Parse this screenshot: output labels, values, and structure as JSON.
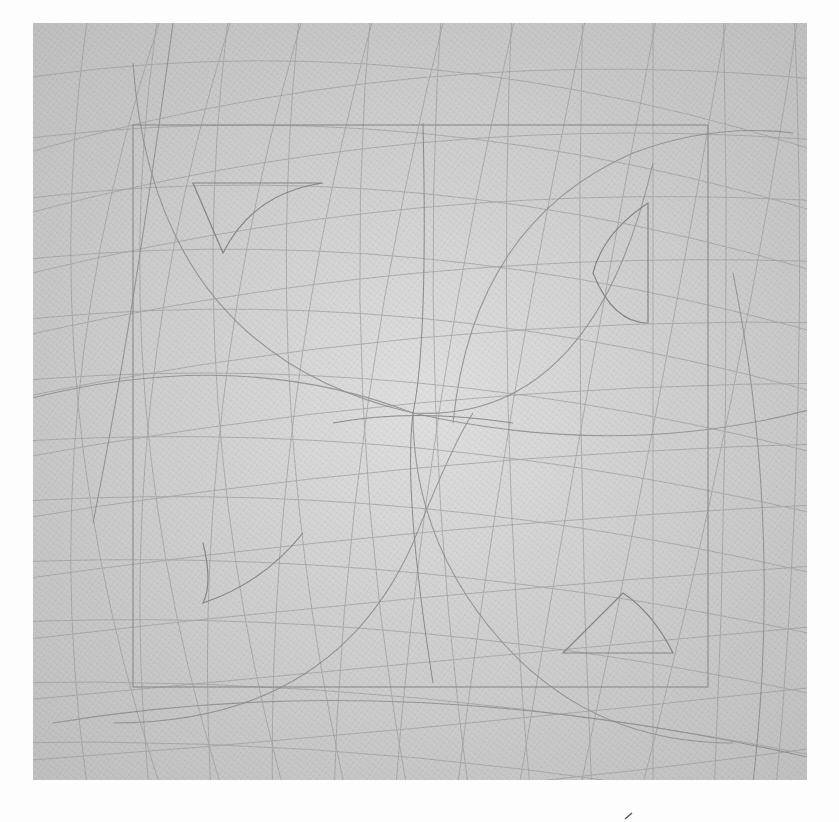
{
  "artwork": {
    "medium_visual": "graphite lines on gray paper",
    "background_color": "#fdfdfd",
    "paper_color": "#cfcfcf",
    "line_color": "#8a8a8a",
    "paper_bounds": {
      "x": 33,
      "y": 23,
      "width": 774,
      "height": 757
    },
    "inner_square": {
      "x": 133,
      "y": 125,
      "width": 575,
      "height": 562
    },
    "motifs": [
      {
        "name": "upper-left-lens",
        "position": "top-left quadrant"
      },
      {
        "name": "upper-right-leaf",
        "position": "top-right quadrant"
      },
      {
        "name": "lower-left-leaf",
        "position": "bottom-left quadrant"
      },
      {
        "name": "lower-right-lens",
        "position": "bottom-right quadrant"
      }
    ],
    "margin_mark": {
      "x": 630,
      "y": 818,
      "glyph": "´"
    }
  }
}
